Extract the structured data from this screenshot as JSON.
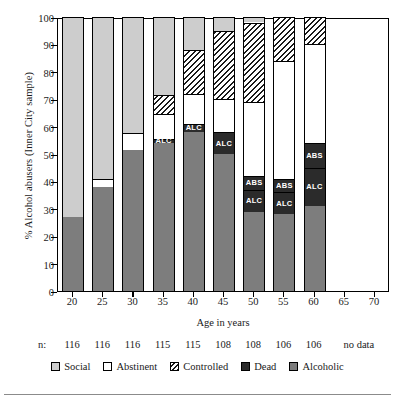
{
  "chart_data": {
    "type": "bar",
    "subtype": "stacked-100-percent",
    "title": "",
    "xlabel": "Age in years",
    "ylabel": "% Alcohol abusers (Inner City sample)",
    "ylim": [
      0,
      100
    ],
    "yticks": [
      0,
      10,
      20,
      30,
      40,
      50,
      60,
      70,
      80,
      90,
      100
    ],
    "xticks": [
      20,
      25,
      30,
      35,
      40,
      45,
      50,
      55,
      60,
      65,
      70
    ],
    "categories": [
      "20",
      "25",
      "30",
      "35",
      "40",
      "45",
      "50",
      "55",
      "60",
      "65",
      "70"
    ],
    "grid": false,
    "legend_position": "bottom",
    "legend": [
      "Social",
      "Abstinent",
      "Controlled",
      "Dead",
      "Alcoholic"
    ],
    "series": [
      {
        "name": "Alcoholic",
        "values": [
          27,
          38,
          51.5,
          54,
          58,
          50,
          29,
          28,
          31,
          null,
          null
        ]
      },
      {
        "name": "Dead ALC",
        "values": [
          0,
          0,
          0,
          1.5,
          3,
          8,
          8,
          8,
          14,
          null,
          null
        ]
      },
      {
        "name": "Dead ABS",
        "values": [
          0,
          0,
          0,
          0,
          0,
          0,
          5,
          5,
          9,
          null,
          null
        ]
      },
      {
        "name": "Abstinent",
        "values": [
          0,
          3,
          6,
          9,
          11,
          12,
          27,
          43,
          36,
          null,
          null
        ]
      },
      {
        "name": "Controlled",
        "values": [
          0,
          0,
          0,
          7,
          16,
          25,
          29,
          16,
          10,
          null,
          null
        ]
      },
      {
        "name": "Social",
        "values": [
          73,
          59,
          42.5,
          28.5,
          12,
          5,
          2,
          0,
          0,
          null,
          null
        ]
      }
    ],
    "bar_labels": {
      "dead_abstinent": "ABS",
      "dead_alcoholic": "ALC"
    },
    "sample_sizes": {
      "prefix": "n:",
      "values": [
        "116",
        "116",
        "116",
        "115",
        "115",
        "108",
        "108",
        "106",
        "106"
      ],
      "no_data_text": "no data"
    },
    "colors": {
      "social": "#cdcdcd",
      "abstinent": "#ffffff",
      "controlled": "#1a1a1a",
      "dead": "#2b2b2b",
      "alcoholic": "#7d7d7d",
      "axis": "#000000"
    }
  }
}
